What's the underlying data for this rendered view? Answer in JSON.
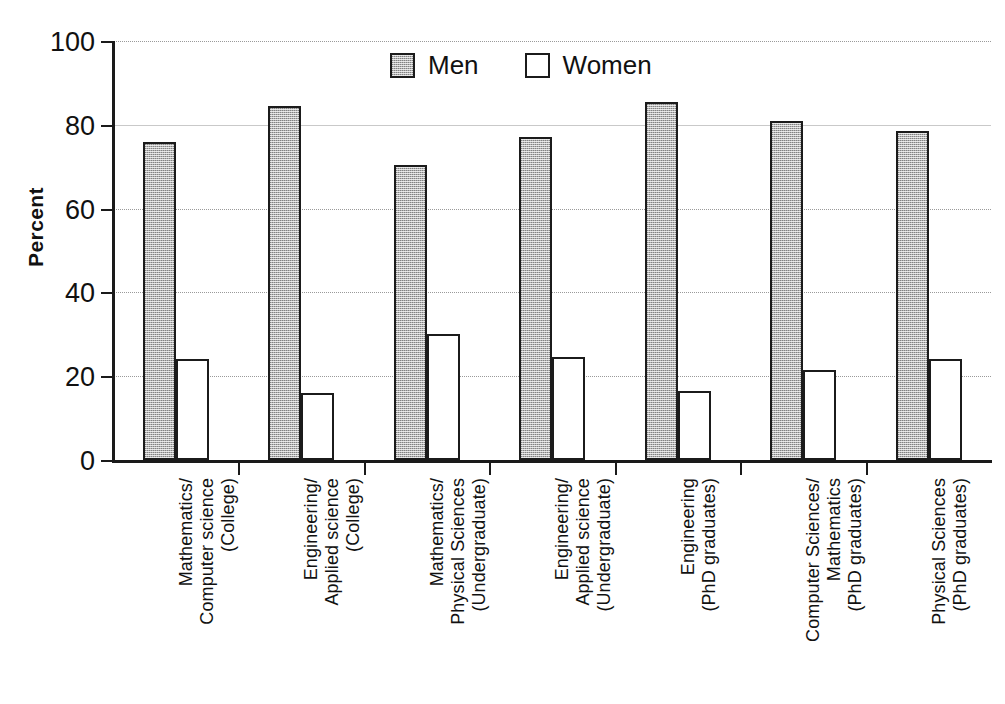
{
  "chart_data": {
    "type": "bar",
    "title": "",
    "xlabel": "",
    "ylabel": "Percent",
    "ylim": [
      0,
      100
    ],
    "yticks": [
      0,
      20,
      40,
      60,
      80,
      100
    ],
    "grid": true,
    "legend_position": "top-center",
    "categories": [
      "Mathematics/\nComputer science\n(College)",
      "Engineering/\nApplied science\n(College)",
      "Mathematics/\nPhysical Sciences\n(Undergraduate)",
      "Engineering/\nApplied science\n(Undergraduate)",
      "Engineering\n(PhD graduates)",
      "Computer Sciences/\nMathematics\n(PhD graduates)",
      "Physical Sciences\n(PhD graduates)"
    ],
    "series": [
      {
        "name": "Men",
        "color": "#b4b4b4",
        "values": [
          76,
          84.5,
          70.5,
          77,
          85.5,
          81,
          78.5
        ]
      },
      {
        "name": "Women",
        "color": "#ffffff",
        "values": [
          24,
          16,
          30,
          24.5,
          16.5,
          21.5,
          24
        ]
      }
    ]
  },
  "axis": {
    "y_tick_labels": [
      "0",
      "20",
      "40",
      "60",
      "80",
      "100"
    ],
    "y_axis_title": "Percent"
  },
  "legend": {
    "items": [
      {
        "label": "Men",
        "swatch": "men-swatch"
      },
      {
        "label": "Women",
        "swatch": "women-swatch"
      }
    ]
  }
}
